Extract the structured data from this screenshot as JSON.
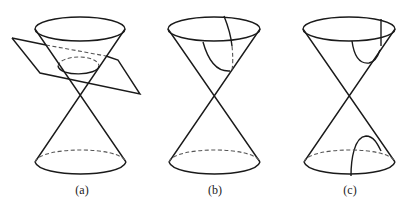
{
  "diagram": {
    "title_fragment": "",
    "figures": [
      {
        "id": "a",
        "caption": "(a)",
        "description": "double cone cut by an oblique plane producing an ellipse"
      },
      {
        "id": "b",
        "caption": "(b)",
        "description": "double cone with a parabola section on the upper nappe"
      },
      {
        "id": "c",
        "caption": "(c)",
        "description": "double cone with hyperbola branches on both nappes"
      }
    ],
    "colors": {
      "stroke": "#1a1a1a",
      "dashed": "#555555",
      "background": "#ffffff"
    }
  }
}
